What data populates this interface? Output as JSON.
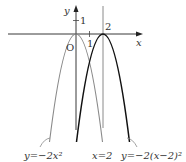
{
  "diagram": {
    "axes": {
      "x_label": "x",
      "y_label": "y",
      "origin_label": "O"
    },
    "ticks": {
      "y_one": "1",
      "x_one": "1",
      "x_two": "2"
    },
    "curves": [
      {
        "name": "gray-parabola",
        "equation": "y=−2x²",
        "color": "#8a8a8a"
      },
      {
        "name": "black-parabola",
        "equation": "y=−2(x−2)²",
        "color": "#111111"
      }
    ],
    "line": {
      "equation": "x=2",
      "color": "#8a8a8a"
    },
    "labels": {
      "gray": "y=−2x²",
      "line": "x=2",
      "black": "y=−2(x−2)²"
    }
  }
}
